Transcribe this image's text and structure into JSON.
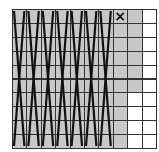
{
  "diagram": {
    "columns": 10,
    "rows": 10,
    "colors": {
      "shaded": "#c8c8c8",
      "empty": "#ffffff",
      "line": "#111111",
      "grid": "#333333"
    },
    "crossed_columns": 7,
    "cells": {
      "shaded_full_columns": [
        0,
        1,
        2,
        3,
        4,
        5,
        6,
        7
      ],
      "column_8_shaded_rows": 6,
      "column_9_shaded_rows": 0
    },
    "marker": {
      "symbol": "×",
      "column": 7,
      "row": 0
    }
  }
}
